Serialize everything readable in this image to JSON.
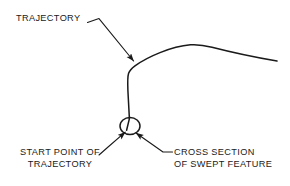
{
  "diagram": {
    "background_color": "#ffffff",
    "line_color": "#1a1a1a",
    "text_color": "#1a1a1a",
    "annotations": {
      "trajectory": {
        "label": "TRAJECTORY",
        "lines": [
          "TRAJECTORY"
        ]
      },
      "start_point": {
        "label": "START POINT OF TRAJECTORY",
        "lines": [
          "START POINT OF",
          "TRAJECTORY"
        ]
      },
      "cross_section": {
        "label": "CROSS SECTION OF SWEPT FEATURE",
        "lines": [
          "CROSS SECTION",
          "OF SWEPT FEATURE"
        ]
      }
    },
    "geometry": {
      "trajectory_path_description": "Open swept path starting at circle marker, running vertically upward, bending right, rising to a crest and descending to the right edge",
      "cross_section_marker": {
        "shape": "ellipse",
        "center_x": 130,
        "center_y": 126,
        "radius_x": 10,
        "radius_y": 8.5
      }
    }
  }
}
